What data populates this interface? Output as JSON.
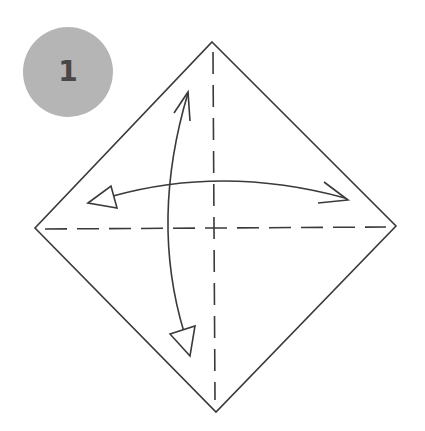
{
  "step": {
    "number": "1",
    "badge_color": "#b5b5b5",
    "number_color": "#484848"
  },
  "diagram": {
    "paper": {
      "shape": "diamond",
      "vertices": {
        "top": [
          212,
          42
        ],
        "right": [
          396,
          226
        ],
        "bottom": [
          216,
          412
        ],
        "left": [
          35,
          228
        ]
      }
    },
    "fold_lines": [
      {
        "name": "vertical-valley-fold",
        "style": "dashed"
      },
      {
        "name": "horizontal-valley-fold",
        "style": "dashed"
      }
    ],
    "arrows": [
      {
        "name": "horizontal-fold-unfold-arrow",
        "type": "double-headed-curved"
      },
      {
        "name": "vertical-fold-unfold-arrow",
        "type": "double-headed-curved"
      }
    ],
    "stroke_color": "#3a3a3a"
  }
}
